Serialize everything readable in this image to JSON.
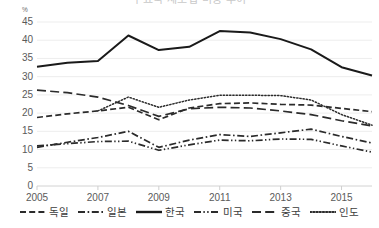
{
  "chart_data": {
    "type": "line",
    "title": "주요국 제조업 비중 추이",
    "unit_label": "%",
    "xlabel": "",
    "ylabel": "",
    "ylim": [
      0,
      45
    ],
    "ytick_values": [
      45,
      40,
      35,
      30,
      25,
      20,
      15,
      10,
      5,
      0
    ],
    "x": [
      2005,
      2006,
      2007,
      2008,
      2009,
      2010,
      2011,
      2012,
      2013,
      2014,
      2015,
      2016
    ],
    "xtick_labels": [
      "2005",
      "2007",
      "2009",
      "2011",
      "2013",
      "2015"
    ],
    "xtick_values": [
      2005,
      2007,
      2009,
      2011,
      2013,
      2015
    ],
    "grid": true,
    "legend_position": "bottom",
    "series": [
      {
        "name": "독일",
        "style": "dashed",
        "color": "#2b2b2b",
        "values": [
          18.8,
          19.8,
          20.6,
          21.6,
          18.2,
          21.4,
          22.6,
          22.8,
          22.4,
          22.2,
          21.3,
          20.4
        ]
      },
      {
        "name": "일본",
        "style": "dash-dot",
        "color": "#2b2b2b",
        "values": [
          10.6,
          12.0,
          13.3,
          15.0,
          10.6,
          12.6,
          14.1,
          13.6,
          14.6,
          15.6,
          13.6,
          11.8
        ]
      },
      {
        "name": "한국",
        "style": "solid",
        "color": "#1a1a1a",
        "values": [
          32.7,
          33.8,
          34.3,
          41.3,
          37.3,
          38.2,
          42.5,
          42.1,
          40.3,
          37.5,
          32.6,
          30.3
        ]
      },
      {
        "name": "미국",
        "style": "dash-dot-dot",
        "color": "#2b2b2b",
        "values": [
          11.0,
          11.6,
          12.2,
          12.3,
          9.8,
          11.3,
          12.6,
          12.4,
          12.9,
          12.8,
          11.0,
          9.3
        ]
      },
      {
        "name": "중국",
        "style": "long-dash",
        "color": "#2b2b2b",
        "values": [
          26.3,
          25.6,
          24.4,
          22.1,
          19.1,
          21.2,
          21.6,
          21.4,
          20.6,
          19.6,
          17.9,
          16.5
        ]
      },
      {
        "name": "인도",
        "style": "dotted",
        "color": "#2b2b2b",
        "values": [
          null,
          null,
          20.6,
          24.4,
          21.6,
          23.6,
          24.9,
          24.9,
          24.8,
          23.6,
          19.6,
          16.7
        ]
      }
    ]
  }
}
